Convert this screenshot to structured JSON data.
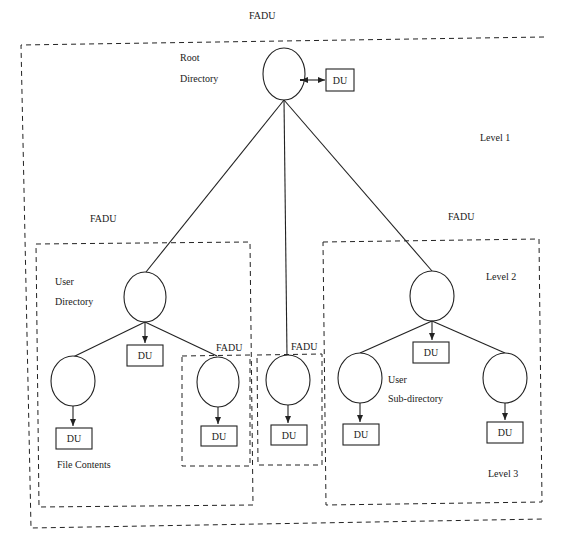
{
  "diagram": {
    "title_label": "FADU",
    "outer_fadu": {
      "label": "FADU"
    },
    "root": {
      "label_line1": "Root",
      "label_line2": "Directory",
      "du": "DU"
    },
    "levels": {
      "level1": "Level 1",
      "level2": "Level 2",
      "level3": "Level 3"
    },
    "left_fadu": {
      "label": "FADU",
      "user_directory": {
        "label_line1": "User",
        "label_line2": "Directory",
        "du": "DU"
      },
      "file_node": {
        "du": "DU",
        "caption": "File Contents"
      },
      "nested_fadu": {
        "label": "FADU",
        "du": "DU"
      }
    },
    "middle_fadu": {
      "label": "FADU",
      "du": "DU"
    },
    "right_fadu": {
      "label": "FADU",
      "directory": {
        "du": "DU"
      },
      "sub_directory": {
        "label_line1": "User",
        "label_line2": "Sub-directory",
        "du": "DU"
      },
      "right_leaf": {
        "du": "DU"
      }
    }
  }
}
